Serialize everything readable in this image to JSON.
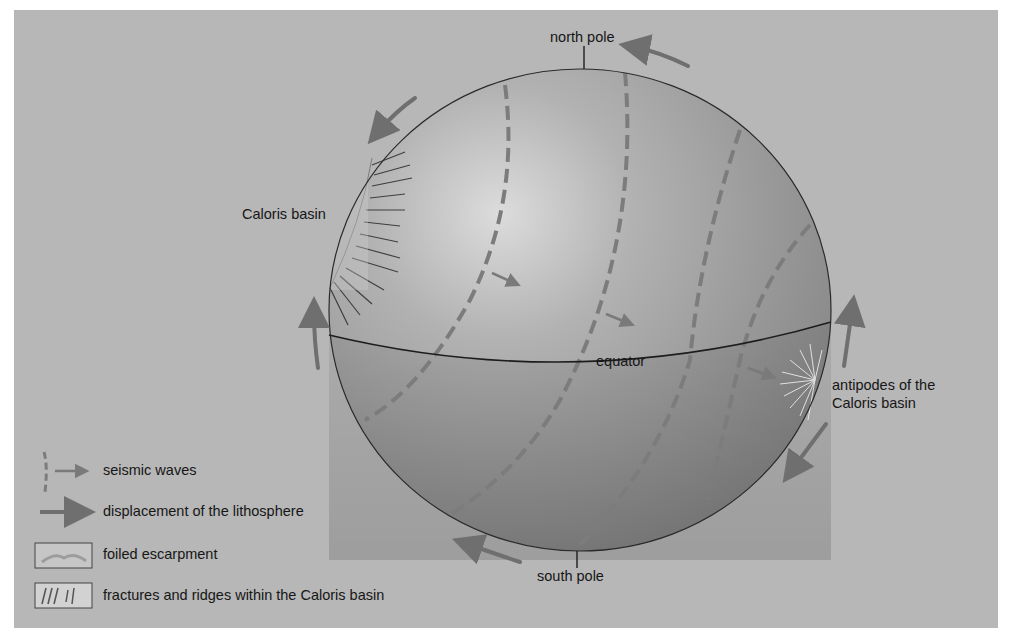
{
  "figure": {
    "background_color": "#b7b7b7",
    "sphere_color": "#9a9a9a",
    "arrow_color": "#6f6f6f",
    "labels": {
      "north_pole": "north pole",
      "south_pole": "south pole",
      "equator": "equator",
      "caloris_basin": "Caloris basin",
      "antipodes_line1": "antipodes of the",
      "antipodes_line2": "Caloris basin"
    }
  },
  "legend": {
    "items": [
      {
        "icon": "seismic-wave-icon",
        "label": "seismic waves"
      },
      {
        "icon": "displacement-arrow-icon",
        "label": "displacement of the lithosphere"
      },
      {
        "icon": "foiled-escarpment-swatch",
        "label": "foiled escarpment"
      },
      {
        "icon": "fractures-ridges-swatch",
        "label": "fractures and ridges within the Caloris basin"
      }
    ]
  }
}
